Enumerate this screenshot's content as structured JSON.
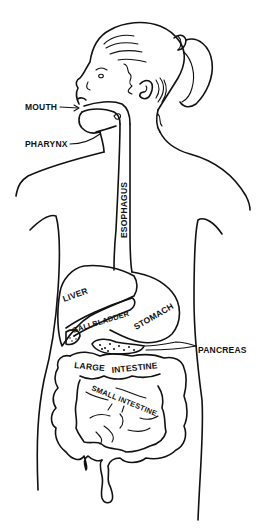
{
  "diagram": {
    "colors": {
      "line": "#111111",
      "background": "#ffffff"
    },
    "labels": {
      "mouth": "MOUTH",
      "pharynx": "PHARYNX",
      "esophagus": "ESOPHAGUS",
      "liver": "LIVER",
      "gallbladder": "GALLBLADDER",
      "stomach": "STOMACH",
      "pancreas": "PANCREAS",
      "large_intestine_1": "LARGE",
      "large_intestine_2": "INTESTINE",
      "small_intestine": "SMALL INTESTINE"
    }
  }
}
